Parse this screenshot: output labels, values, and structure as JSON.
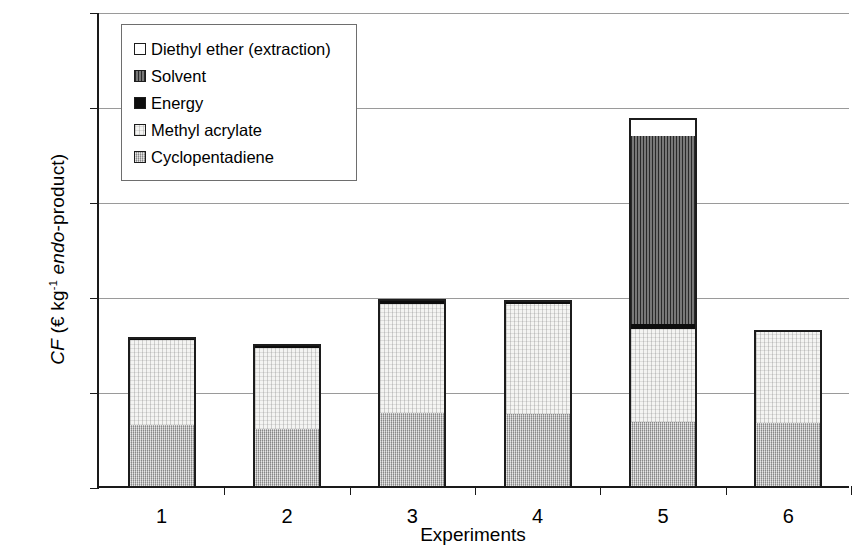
{
  "chart_data": {
    "type": "bar",
    "stacked": true,
    "title": "",
    "xlabel": "Experiments",
    "ylabel": "CF (€ kg⁻¹ endo-product)",
    "ylabel_parts": {
      "italic1": "CF",
      "roman1": " (€ kg",
      "sup": "-1",
      "italic2": " endo",
      "roman2": "-product)"
    },
    "categories": [
      "1",
      "2",
      "3",
      "4",
      "5",
      "6"
    ],
    "ylim": [
      0,
      100
    ],
    "yticks": [
      0,
      20,
      40,
      60,
      80,
      100
    ],
    "ytick_labels": [
      "0",
      "20",
      "40",
      "60",
      "80",
      "100"
    ],
    "grid": true,
    "legend_position": "upper-left-inside",
    "series": [
      {
        "name": "Diethyl ether (extraction)",
        "swatch": "white-open",
        "color": "#ffffff",
        "values": [
          0,
          0,
          0,
          0,
          3.9,
          0
        ]
      },
      {
        "name": "Solvent",
        "swatch": "dark-hatched",
        "color": "#5a5a5a",
        "values": [
          0,
          0,
          0,
          0,
          39.5,
          0
        ]
      },
      {
        "name": "Energy",
        "swatch": "solid-black",
        "color": "#0d0d0d",
        "values": [
          0.7,
          0.7,
          0.9,
          0.9,
          1.1,
          0
        ]
      },
      {
        "name": "Methyl acrylate",
        "swatch": "light-dotted",
        "color": "#f4f4f2",
        "values": [
          17.8,
          17.0,
          23.0,
          23.1,
          19.5,
          19.5
        ]
      },
      {
        "name": "Cyclopentadiene",
        "swatch": "grey-dotted",
        "color": "#b8b8b8",
        "values": [
          12.9,
          12.1,
          15.4,
          15.2,
          13.5,
          13.3
        ]
      }
    ],
    "totals": [
      31.4,
      29.8,
      39.3,
      39.2,
      77.5,
      32.8
    ]
  },
  "legend": {
    "items": [
      {
        "label": "Diethyl ether (extraction)"
      },
      {
        "label": "Solvent"
      },
      {
        "label": "Energy"
      },
      {
        "label": "Methyl acrylate"
      },
      {
        "label": "Cyclopentadiene"
      }
    ]
  },
  "axis": {
    "y_title_italic1": "CF",
    "y_title_roman1": " (€ kg",
    "y_title_sup": "-1",
    "y_title_italic2": " endo",
    "y_title_roman2": "-product)",
    "x_title": "Experiments"
  }
}
